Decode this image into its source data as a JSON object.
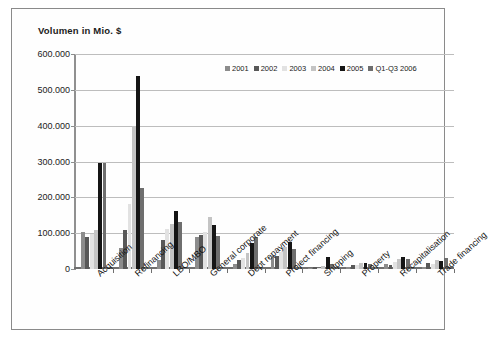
{
  "chart_data": {
    "type": "bar",
    "title": "Volumen in Mio. $",
    "xlabel": "",
    "ylabel": "",
    "ylim": [
      0,
      600000
    ],
    "ytick_labels": [
      "600.000",
      "500.000",
      "400.000",
      "300.000",
      "200.000",
      "100.000",
      "0"
    ],
    "ytick_values": [
      600000,
      500000,
      400000,
      300000,
      200000,
      100000,
      0
    ],
    "grid": true,
    "legend_position": "top-right inside",
    "categories": [
      "Acquisition",
      "Refinancing",
      "LBO/MBO",
      "General corporate",
      "Dept repayment",
      "Project financing",
      "Shipping",
      "Property",
      "Recapitalisation",
      "Trade financing"
    ],
    "series": [
      {
        "name": "2001",
        "color": "#8c8c8c",
        "values": [
          102000,
          58000,
          26000,
          88000,
          14000,
          37000,
          3000,
          5000,
          14000,
          5000
        ]
      },
      {
        "name": "2002",
        "color": "#585858",
        "values": [
          88000,
          110000,
          81000,
          95000,
          26000,
          36000,
          5000,
          12000,
          10000,
          17000
        ]
      },
      {
        "name": "2003",
        "color": "#e2e2e2",
        "values": [
          97000,
          182000,
          112000,
          104000,
          32000,
          47000,
          4000,
          10000,
          20000,
          14000
        ]
      },
      {
        "name": "2004",
        "color": "#c4c4c4",
        "values": [
          108000,
          400000,
          126000,
          145000,
          44000,
          62000,
          9000,
          17000,
          27000,
          24000
        ]
      },
      {
        "name": "2005",
        "color": "#151515",
        "values": [
          296000,
          540000,
          163000,
          123000,
          73000,
          74000,
          33000,
          18000,
          33000,
          21000
        ]
      },
      {
        "name": "Q1-Q3 2006",
        "color": "#6e6e6e",
        "values": [
          297000,
          225000,
          131000,
          92000,
          88000,
          56000,
          13000,
          15000,
          27000,
          31000
        ]
      }
    ]
  }
}
